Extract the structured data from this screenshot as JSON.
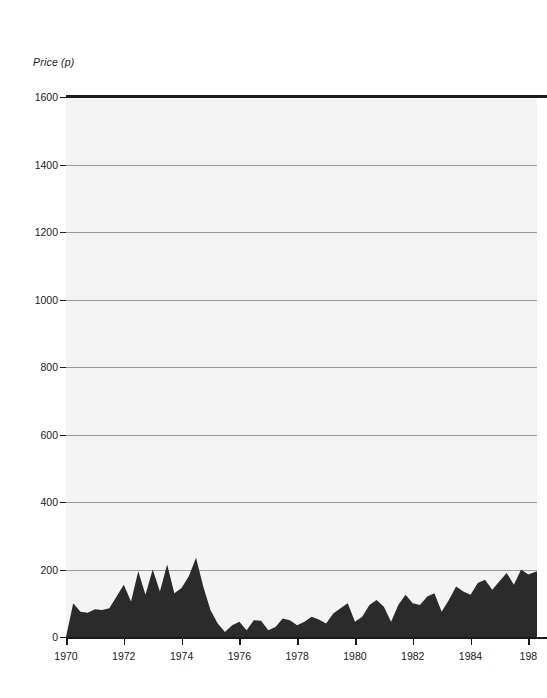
{
  "chart_data": {
    "type": "area",
    "title": "",
    "xlabel": "",
    "ylabel": "Price (p)",
    "ylim": [
      0,
      1600
    ],
    "xlim": [
      1970,
      1986.3
    ],
    "grid": true,
    "legend": null,
    "fill_color": "#2b2b2b",
    "plot_background": "#f4f4f4",
    "gridline_color": "#9a9a9a",
    "axis_color": "#1a1a1a",
    "ytick_labels": [
      "0",
      "200",
      "400",
      "600",
      "800",
      "1000",
      "1200",
      "1400",
      "1600"
    ],
    "ytick_values": [
      0,
      200,
      400,
      600,
      800,
      1000,
      1200,
      1400,
      1600
    ],
    "xtick_labels": [
      "1970",
      "1972",
      "1974",
      "1976",
      "1978",
      "1980",
      "1982",
      "1984",
      "198"
    ],
    "xtick_values": [
      1970,
      1972,
      1974,
      1976,
      1978,
      1980,
      1982,
      1984,
      1986
    ],
    "note": "Right edge of plot is cropped by the image border; final x tick label is truncated to '198'.",
    "x": [
      1970.0,
      1970.25,
      1970.5,
      1970.75,
      1971.0,
      1971.25,
      1971.5,
      1971.75,
      1972.0,
      1972.25,
      1972.5,
      1972.75,
      1973.0,
      1973.25,
      1973.5,
      1973.75,
      1974.0,
      1974.25,
      1974.5,
      1974.75,
      1975.0,
      1975.25,
      1975.5,
      1975.75,
      1976.0,
      1976.25,
      1976.5,
      1976.75,
      1977.0,
      1977.25,
      1977.5,
      1977.75,
      1978.0,
      1978.25,
      1978.5,
      1978.75,
      1979.0,
      1979.25,
      1979.5,
      1979.75,
      1980.0,
      1980.25,
      1980.5,
      1980.75,
      1981.0,
      1981.25,
      1981.5,
      1981.75,
      1982.0,
      1982.25,
      1982.5,
      1982.75,
      1983.0,
      1983.25,
      1983.5,
      1983.75,
      1984.0,
      1984.25,
      1984.5,
      1984.75,
      1985.0,
      1985.25,
      1985.5,
      1985.75,
      1986.0,
      1986.3
    ],
    "values": [
      0,
      100,
      75,
      72,
      82,
      80,
      85,
      120,
      155,
      105,
      195,
      125,
      200,
      135,
      215,
      130,
      145,
      180,
      235,
      150,
      80,
      40,
      15,
      35,
      45,
      20,
      50,
      48,
      20,
      30,
      55,
      50,
      35,
      45,
      60,
      52,
      40,
      70,
      85,
      100,
      45,
      60,
      95,
      110,
      90,
      45,
      95,
      125,
      100,
      95,
      120,
      130,
      75,
      110,
      150,
      135,
      125,
      160,
      170,
      140,
      165,
      190,
      155,
      200,
      185,
      195
    ],
    "series_name": "Price (p)",
    "units": "pence"
  },
  "axes": {
    "y_axis_label": "Price (p)"
  }
}
